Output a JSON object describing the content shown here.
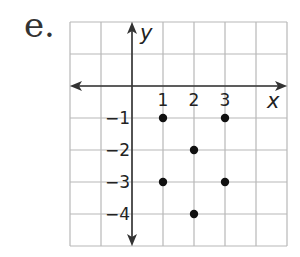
{
  "problem_label": "e.",
  "graph": {
    "x_axis_label": "x",
    "y_axis_label": "y",
    "x_ticks": [
      {
        "value": 1,
        "label": "1"
      },
      {
        "value": 2,
        "label": "2"
      },
      {
        "value": 3,
        "label": "3"
      }
    ],
    "y_ticks": [
      {
        "value": -1,
        "label": "−1"
      },
      {
        "value": -2,
        "label": "−2"
      },
      {
        "value": -3,
        "label": "−3"
      },
      {
        "value": -4,
        "label": "−4"
      }
    ],
    "x_range": [
      -2,
      5
    ],
    "y_range": [
      -5,
      2
    ],
    "points": [
      {
        "x": 1,
        "y": -1
      },
      {
        "x": 3,
        "y": -1
      },
      {
        "x": 2,
        "y": -2
      },
      {
        "x": 1,
        "y": -3
      },
      {
        "x": 3,
        "y": -3
      },
      {
        "x": 2,
        "y": -4
      }
    ],
    "colors": {
      "grid": "#b8b8b8",
      "axis": "#333333",
      "point": "#111111"
    }
  }
}
